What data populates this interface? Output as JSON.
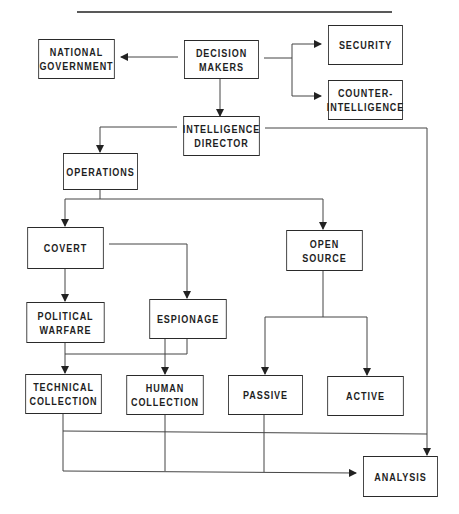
{
  "diagram": {
    "title": "",
    "colors": {
      "line": "#444444",
      "border": "#2a2a2a",
      "text": "#1e1e1e",
      "background": "#ffffff"
    },
    "nodes": {
      "national_government": {
        "label": "NATIONAL\nGOVERNMENT"
      },
      "decision_makers": {
        "label": "DECISION\nMAKERS"
      },
      "security": {
        "label": "SECURITY"
      },
      "counter_intelligence": {
        "label": "COUNTER-\nINTELLIGENCE"
      },
      "intelligence_director": {
        "label": "INTELLIGENCE\nDIRECTOR"
      },
      "operations": {
        "label": "OPERATIONS"
      },
      "covert": {
        "label": "COVERT"
      },
      "open_source": {
        "label": "OPEN SOURCE"
      },
      "political_warfare": {
        "label": "POLITICAL\nWARFARE"
      },
      "espionage": {
        "label": "ESPIONAGE"
      },
      "technical_collection": {
        "label": "TECHNICAL\nCOLLECTION"
      },
      "human_collection": {
        "label": "HUMAN\nCOLLECTION"
      },
      "passive": {
        "label": "PASSIVE"
      },
      "active": {
        "label": "ACTIVE"
      },
      "analysis": {
        "label": "ANALYSIS"
      }
    },
    "edges": [
      {
        "from": "DECISION MAKERS",
        "to": "NATIONAL GOVERNMENT"
      },
      {
        "from": "DECISION MAKERS",
        "to": "SECURITY"
      },
      {
        "from": "DECISION MAKERS",
        "to": "COUNTER-INTELLIGENCE"
      },
      {
        "from": "DECISION MAKERS",
        "to": "INTELLIGENCE DIRECTOR"
      },
      {
        "from": "INTELLIGENCE DIRECTOR",
        "to": "OPERATIONS"
      },
      {
        "from": "INTELLIGENCE DIRECTOR",
        "to": "ANALYSIS"
      },
      {
        "from": "OPERATIONS",
        "to": "COVERT"
      },
      {
        "from": "OPERATIONS",
        "to": "OPEN SOURCE"
      },
      {
        "from": "COVERT",
        "to": "POLITICAL WARFARE"
      },
      {
        "from": "COVERT",
        "to": "ESPIONAGE"
      },
      {
        "from": "POLITICAL WARFARE",
        "to": "TECHNICAL COLLECTION"
      },
      {
        "from": "ESPIONAGE",
        "to": "TECHNICAL COLLECTION"
      },
      {
        "from": "ESPIONAGE",
        "to": "HUMAN COLLECTION"
      },
      {
        "from": "OPEN SOURCE",
        "to": "PASSIVE"
      },
      {
        "from": "OPEN SOURCE",
        "to": "ACTIVE"
      },
      {
        "from": "TECHNICAL COLLECTION",
        "to": "ANALYSIS"
      },
      {
        "from": "HUMAN COLLECTION",
        "to": "ANALYSIS"
      },
      {
        "from": "PASSIVE",
        "to": "ANALYSIS"
      }
    ]
  }
}
